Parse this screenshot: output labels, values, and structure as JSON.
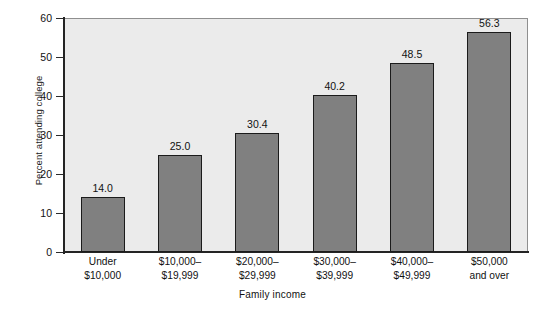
{
  "chart_data": {
    "type": "bar",
    "title": "",
    "xlabel": "Family income",
    "ylabel": "Percent attending college",
    "categories": [
      "Under\n$10,000",
      "$10,000–\n$19,999",
      "$20,000–\n$29,999",
      "$30,000–\n$39,999",
      "$40,000–\n$49,999",
      "$50,000\nand over"
    ],
    "category_lines": [
      [
        "Under",
        "$10,000"
      ],
      [
        "$10,000–",
        "$19,999"
      ],
      [
        "$20,000–",
        "$29,999"
      ],
      [
        "$30,000–",
        "$39,999"
      ],
      [
        "$40,000–",
        "$49,999"
      ],
      [
        "$50,000",
        "and over"
      ]
    ],
    "values": [
      14.0,
      25.0,
      30.4,
      40.2,
      48.5,
      56.3
    ],
    "value_labels": [
      "14.0",
      "25.0",
      "30.4",
      "40.2",
      "48.5",
      "56.3"
    ],
    "ylim": [
      0,
      60
    ],
    "yticks": [
      0,
      10,
      20,
      30,
      40,
      50,
      60
    ],
    "ytick_labels": [
      "0",
      "10",
      "20",
      "30",
      "40",
      "50",
      "60"
    ],
    "grid": false,
    "legend": null,
    "colors": {
      "bar_fill": "#808080",
      "bar_edge": "#1b1b1b",
      "plot_background": "#ebebeb",
      "axis": "#242424",
      "text": "#111111",
      "page_background": "#ffffff"
    }
  }
}
